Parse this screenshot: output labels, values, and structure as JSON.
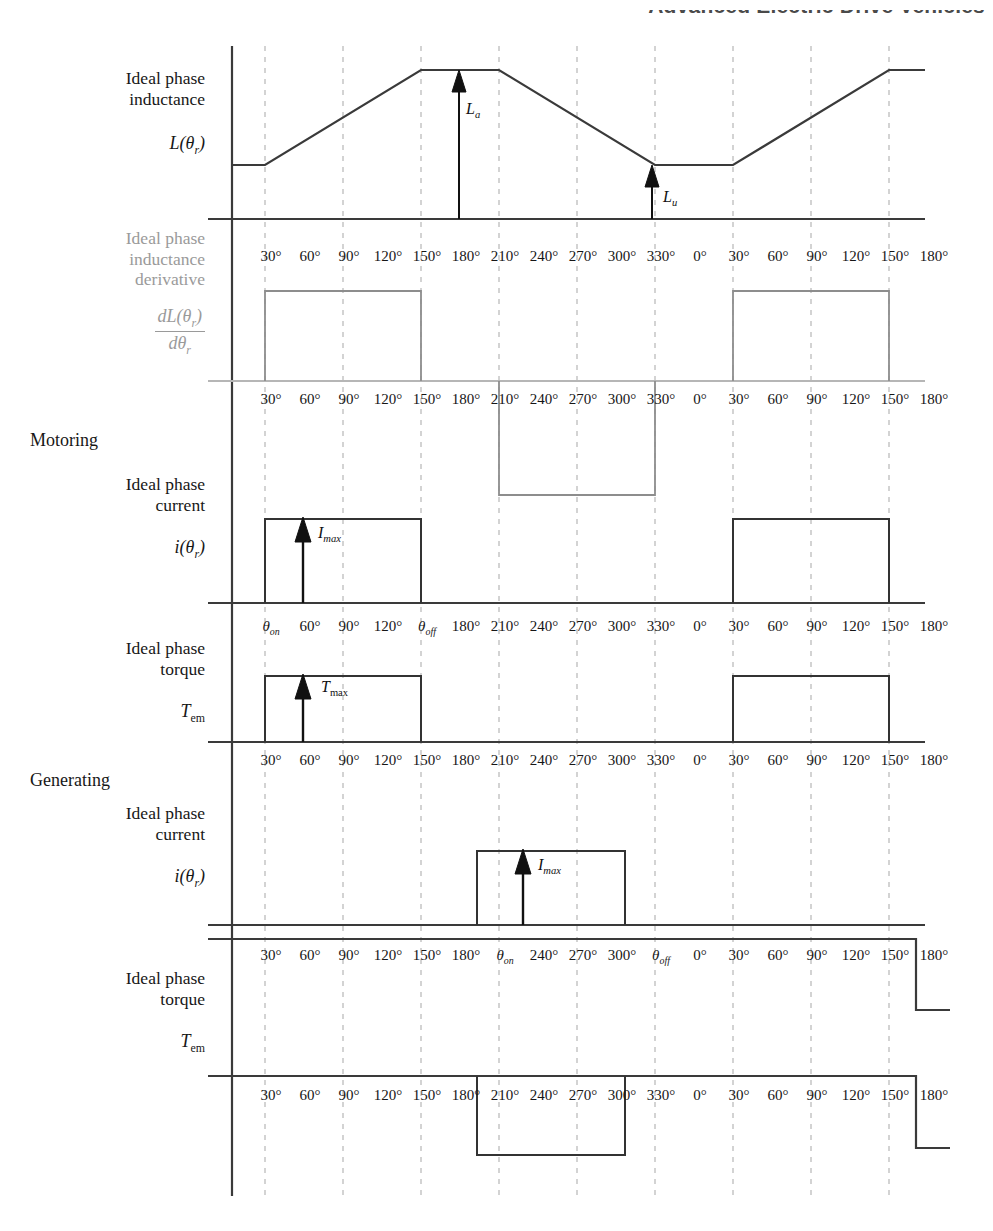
{
  "page": {
    "running_head": "Advanced Electric Drive Vehicles",
    "folio": "",
    "caption": "FIGURE 6.11   Torque production in switched reluctance machine."
  },
  "colors": {
    "ink": "#1a1a1a",
    "faint_ink": "#9a9a9a",
    "gridline": "#c9c9c9",
    "axis": "#3a3a3a"
  },
  "axis": {
    "tick_labels": [
      "30°",
      "60°",
      "90°",
      "120°",
      "150°",
      "180°",
      "210°",
      "240°",
      "270°",
      "300°",
      "330°",
      "0°",
      "30°",
      "60°",
      "90°",
      "120°",
      "150°",
      "180°"
    ],
    "theta_on": "θ",
    "theta_on_sub": "on",
    "theta_off": "θ",
    "theta_off_sub": "off"
  },
  "rows": [
    {
      "id": "inductance",
      "title_line1": "Ideal phase",
      "title_line2": "inductance",
      "symbol": "L(θr)",
      "faint": false,
      "annotations": [
        {
          "name": "La",
          "base": "L",
          "sub": "a"
        },
        {
          "name": "Lu",
          "base": "L",
          "sub": "u"
        }
      ]
    },
    {
      "id": "inductance-derivative",
      "title_line1": "Ideal phase",
      "title_line2": "inductance",
      "title_line3": "derivative",
      "symbol_num": "dL(θr)",
      "symbol_den": "dθr",
      "faint": true
    },
    {
      "id": "motoring-current",
      "section": "Motoring",
      "title_line1": "Ideal phase",
      "title_line2": "current",
      "symbol": "i(θr)",
      "faint": false,
      "annotations": [
        {
          "name": "Imax",
          "base": "I",
          "sub": "max"
        }
      ]
    },
    {
      "id": "motoring-torque",
      "title_line1": "Ideal phase",
      "title_line2": "torque",
      "symbol": "Tem",
      "faint": false,
      "annotations": [
        {
          "name": "Tmax",
          "base": "T",
          "sub": "max"
        }
      ]
    },
    {
      "id": "generating-current",
      "section": "Generating",
      "title_line1": "Ideal phase",
      "title_line2": "current",
      "symbol": "i(θr)",
      "faint": false,
      "annotations": [
        {
          "name": "Imax",
          "base": "I",
          "sub": "max"
        }
      ]
    },
    {
      "id": "generating-torque",
      "title_line1": "Ideal phase",
      "title_line2": "torque",
      "symbol": "Tem",
      "faint": false
    }
  ],
  "chart_data": {
    "type": "line",
    "title": "Torque production in switched reluctance machine",
    "xlabel": "Rotor position (electrical degrees)",
    "x_ticks_deg": [
      30,
      60,
      90,
      120,
      150,
      180,
      210,
      240,
      270,
      300,
      330,
      360,
      390,
      420,
      450,
      480,
      510,
      540
    ],
    "x_tick_labels": [
      "30°",
      "60°",
      "90°",
      "120°",
      "150°",
      "180°",
      "210°",
      "240°",
      "270°",
      "300°",
      "330°",
      "0°",
      "30°",
      "60°",
      "90°",
      "120°",
      "150°",
      "180°"
    ],
    "x_range_deg": [
      0,
      555
    ],
    "gridlines_deg": [
      30,
      90,
      150,
      210,
      270,
      330,
      390,
      450,
      510
    ],
    "grid": true,
    "legend": "none",
    "series": [
      {
        "name": "Ideal phase inductance L(θr)",
        "ylabel": "L(θr)",
        "shape": "trapezoidal",
        "points_deg_value": [
          [
            0,
            "Lu"
          ],
          [
            30,
            "Lu"
          ],
          [
            150,
            "La"
          ],
          [
            210,
            "La"
          ],
          [
            330,
            "Lu"
          ],
          [
            390,
            "Lu"
          ],
          [
            510,
            "La"
          ],
          [
            555,
            "La"
          ]
        ],
        "annotations": [
          {
            "label": "La",
            "at_deg": 190,
            "meaning": "aligned (maximum) inductance"
          },
          {
            "label": "Lu",
            "at_deg": 355,
            "meaning": "unaligned (minimum) inductance"
          }
        ]
      },
      {
        "name": "Ideal phase inductance derivative dL(θr)/dθr",
        "ylabel": "dL(θr)/dθr",
        "shape": "square",
        "pulses": [
          {
            "from_deg": 30,
            "to_deg": 150,
            "sign": "positive"
          },
          {
            "from_deg": 210,
            "to_deg": 330,
            "sign": "negative"
          },
          {
            "from_deg": 390,
            "to_deg": 510,
            "sign": "positive"
          }
        ]
      },
      {
        "name": "Motoring ideal phase current i(θr)",
        "ylabel": "i(θr)",
        "shape": "square",
        "pulses": [
          {
            "from_deg": 30,
            "to_deg": 150,
            "sign": "positive",
            "level": "Imax"
          },
          {
            "from_deg": 390,
            "to_deg": 510,
            "sign": "positive",
            "level": "Imax"
          }
        ],
        "annotations": [
          {
            "label": "Imax",
            "at_deg": 60
          }
        ],
        "x_tick_overrides": {
          "30": "θon",
          "150": "θoff"
        }
      },
      {
        "name": "Motoring ideal phase torque Tem",
        "ylabel": "Tem",
        "shape": "square",
        "pulses": [
          {
            "from_deg": 30,
            "to_deg": 150,
            "sign": "positive",
            "level": "Tmax"
          },
          {
            "from_deg": 390,
            "to_deg": 510,
            "sign": "positive",
            "level": "Tmax"
          }
        ],
        "annotations": [
          {
            "label": "Tmax",
            "at_deg": 60
          }
        ]
      },
      {
        "name": "Generating ideal phase current i(θr)",
        "ylabel": "i(θr)",
        "shape": "square",
        "pulses": [
          {
            "from_deg": 210,
            "to_deg": 330,
            "sign": "positive",
            "level": "Imax"
          }
        ],
        "annotations": [
          {
            "label": "Imax",
            "at_deg": 240
          }
        ],
        "x_tick_overrides": {
          "210": "θon",
          "330": "θoff"
        }
      },
      {
        "name": "Generating ideal phase torque Tem",
        "ylabel": "Tem",
        "shape": "square",
        "pulses": [
          {
            "from_deg": 210,
            "to_deg": 330,
            "sign": "negative"
          }
        ]
      }
    ]
  }
}
